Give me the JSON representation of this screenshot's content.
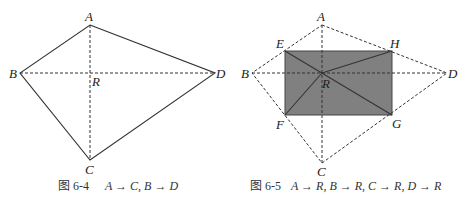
{
  "figures": [
    {
      "id": "fig-6-4",
      "caption_prefix": "图 6-4",
      "caption_formula": "A → C, B → D",
      "points": {
        "A": {
          "label": "A",
          "x": 90,
          "y": 25
        },
        "B": {
          "label": "B",
          "x": 20,
          "y": 73
        },
        "C": {
          "label": "C",
          "x": 90,
          "y": 160
        },
        "D": {
          "label": "D",
          "x": 215,
          "y": 73
        },
        "R": {
          "label": "R",
          "x": 90,
          "y": 73
        }
      }
    },
    {
      "id": "fig-6-5",
      "caption_prefix": "图 6-5",
      "caption_formula": "A → R, B → R, C → R, D → R",
      "points": {
        "A": {
          "label": "A",
          "x": 322,
          "y": 25
        },
        "B": {
          "label": "B",
          "x": 252,
          "y": 73
        },
        "C": {
          "label": "C",
          "x": 322,
          "y": 163
        },
        "D": {
          "label": "D",
          "x": 447,
          "y": 73
        },
        "E": {
          "label": "E",
          "x": 285,
          "y": 51
        },
        "F": {
          "label": "F",
          "x": 285,
          "y": 115
        },
        "G": {
          "label": "G",
          "x": 392,
          "y": 115
        },
        "H": {
          "label": "H",
          "x": 392,
          "y": 51
        },
        "R": {
          "label": "R",
          "x": 322,
          "y": 73
        }
      },
      "fill_color": "#808080"
    }
  ]
}
